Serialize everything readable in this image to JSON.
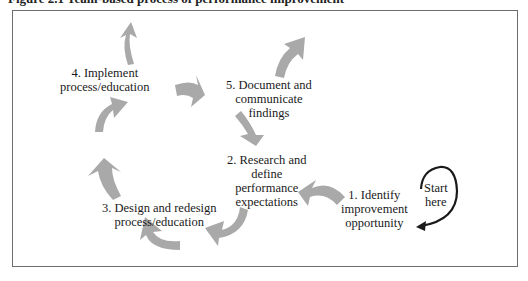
{
  "caption": "Figure 2.1   Team-based process of performance improvement",
  "colors": {
    "arrow_fill": "#a9a9a9",
    "start_arrow": "#1a1a1a",
    "frame": "#6e6e6e"
  },
  "steps": [
    {
      "number": "1.",
      "lines": [
        "1. Identify",
        "improvement",
        "opportunity"
      ]
    },
    {
      "number": "2.",
      "lines": [
        "2. Research and",
        "define",
        "performance",
        "expectations"
      ]
    },
    {
      "number": "3.",
      "lines": [
        "3. Design and redesign",
        "process/education"
      ]
    },
    {
      "number": "4.",
      "lines": [
        "4. Implement",
        "process/education"
      ]
    },
    {
      "number": "5.",
      "lines": [
        "5. Document and",
        "communicate",
        "findings"
      ]
    }
  ],
  "start_marker": {
    "lines": [
      "Start",
      "here"
    ]
  }
}
